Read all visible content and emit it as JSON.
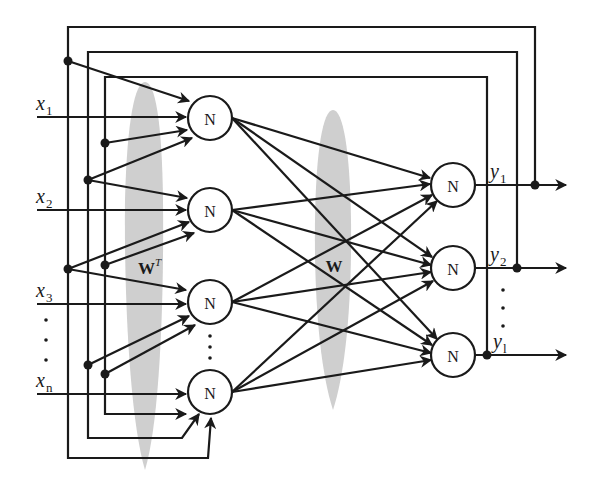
{
  "diagram": {
    "title": "",
    "node_label": "N",
    "weight_labels": {
      "input_layer": "W",
      "input_layer_sup": "T",
      "output_layer": "W"
    },
    "inputs": [
      {
        "base": "x",
        "sub": "1"
      },
      {
        "base": "x",
        "sub": "2"
      },
      {
        "base": "x",
        "sub": "3"
      },
      {
        "base": "x",
        "sub": "n"
      }
    ],
    "outputs": [
      {
        "base": "y",
        "sub": "1"
      },
      {
        "base": "y",
        "sub": "2"
      },
      {
        "base": "y",
        "sub": "l"
      }
    ],
    "ellipsis": "⋮",
    "colors": {
      "line": "#1a1a1a",
      "shade": "#cfcfcf",
      "background": "#ffffff"
    }
  }
}
